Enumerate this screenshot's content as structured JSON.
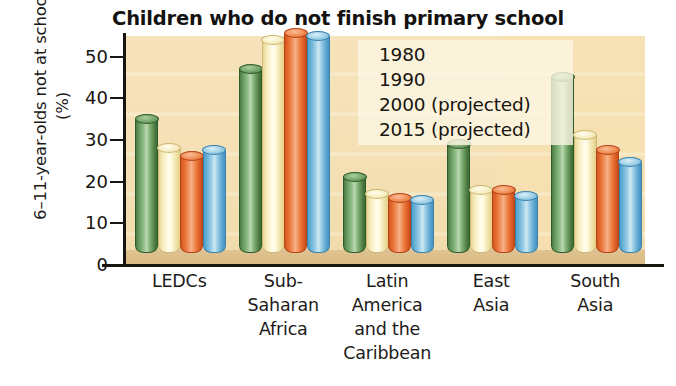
{
  "chart_data": {
    "type": "bar",
    "title": "Children who do not finish primary school",
    "xlabel": "",
    "ylabel": "6–11-year-olds not at school (%)",
    "ylim": [
      0,
      55
    ],
    "yticks": [
      0,
      10,
      20,
      30,
      40,
      50
    ],
    "ytick_labels": [
      "0",
      "10",
      "20",
      "30",
      "40",
      "50"
    ],
    "grid": false,
    "legend_position": "upper-right-inside",
    "categories": [
      "LEDCs",
      "Sub-Saharan Africa",
      "Latin America and the Caribbean",
      "East Asia",
      "South Asia"
    ],
    "category_label_lines": [
      [
        "LEDCs"
      ],
      [
        "Sub-",
        "Saharan",
        "Africa"
      ],
      [
        "Latin",
        "America",
        "and the",
        "Caribbean"
      ],
      [
        "East",
        "Asia"
      ],
      [
        "South",
        "Asia"
      ]
    ],
    "series": [
      {
        "name": "1980",
        "color": "#5d8f52",
        "values": [
          32,
          44,
          18,
          26,
          42
        ]
      },
      {
        "name": "1990",
        "color": "#f4e7b0",
        "values": [
          25,
          51,
          14,
          15,
          28
        ]
      },
      {
        "name": "2000 (projected)",
        "color": "#e4682c",
        "values": [
          23,
          52.5,
          13,
          15,
          24.5
        ]
      },
      {
        "name": "2015 (projected)",
        "color": "#6fb4d8",
        "values": [
          24.5,
          52,
          12.5,
          13.5,
          21.5
        ]
      }
    ]
  },
  "legend": {
    "items": [
      {
        "label": "1980",
        "swatch": "cylinder-green"
      },
      {
        "label": "1990",
        "swatch": "cylinder-yellow"
      },
      {
        "label": "2000 (projected)",
        "swatch": "cylinder-orange"
      },
      {
        "label": "2015 (projected)",
        "swatch": "cylinder-blue"
      }
    ]
  },
  "colors": {
    "plot_background": "#f4e0b4",
    "plot_floor": "#dcbd8a",
    "axis": "#17150f",
    "series_1980": "#5d8f52",
    "series_1990": "#f4e7b0",
    "series_2000": "#e4682c",
    "series_2015": "#6fb4d8",
    "page_background": "#ffffff"
  }
}
